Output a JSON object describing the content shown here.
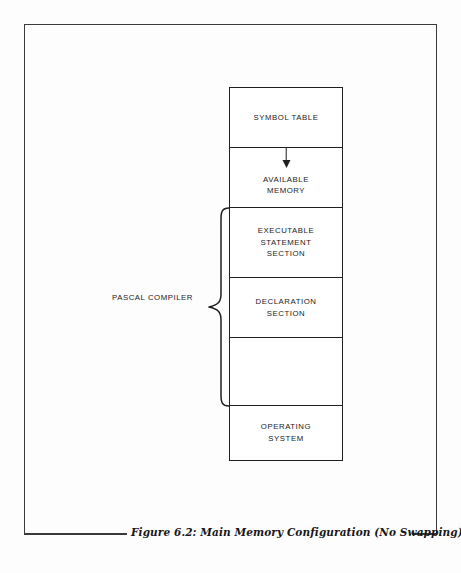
{
  "figure": {
    "caption": "Figure 6.2: Main Memory Configuration (No Swapping)",
    "frame_color": "#3a3a3a",
    "line_color": "#1f1f1f",
    "background": "#fdfdfd"
  },
  "diagram": {
    "type": "memory-map",
    "orientation": "vertical-stack",
    "annotation_label": "PASCAL COMPILER",
    "arrow": {
      "name": "available-memory-growth-arrow",
      "direction": "down",
      "from_section": "SYMBOL TABLE",
      "into_section": "AVAILABLE MEMORY"
    },
    "brace": {
      "name": "pascal-compiler-brace",
      "spans_sections": [
        "EXECUTABLE STATEMENT SECTION",
        "DECLARATION SECTION",
        ""
      ]
    },
    "sections": [
      {
        "label": "SYMBOL TABLE",
        "empty": false
      },
      {
        "label": "AVAILABLE\nMEMORY",
        "empty": false
      },
      {
        "label": "EXECUTABLE\nSTATEMENT\nSECTION",
        "empty": false
      },
      {
        "label": "DECLARATION\nSECTION",
        "empty": false
      },
      {
        "label": "",
        "empty": true
      },
      {
        "label": "OPERATING\nSYSTEM",
        "empty": false
      }
    ]
  }
}
